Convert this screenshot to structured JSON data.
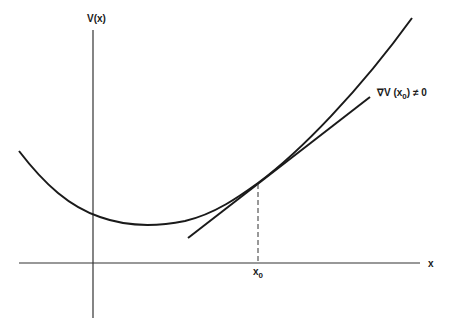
{
  "diagram": {
    "y_axis_label": "V(x)",
    "x_axis_label": "x",
    "point_label": "x",
    "point_label_sub": "0",
    "gradient_label_prefix": "∇V (x",
    "gradient_label_sub": "0",
    "gradient_label_suffix": ") ≠ 0",
    "colors": {
      "line": "#1a1a1a",
      "background": "#ffffff"
    }
  }
}
